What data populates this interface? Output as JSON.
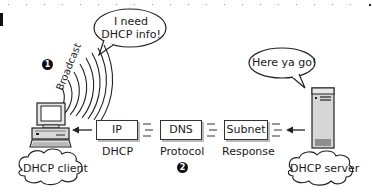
{
  "diagram": {
    "type": "network-flow",
    "client": {
      "label": "DHCP client",
      "speech": "I need\nDHCP info!",
      "speech_line1": "I need",
      "speech_line2": "DHCP info!",
      "signal_label": "Broadcast",
      "step_marker": "1"
    },
    "server": {
      "label": "DHCP server",
      "speech": "Here ya go!"
    },
    "packet_boxes": [
      {
        "text": "IP",
        "caption": "DHCP"
      },
      {
        "text": "DNS",
        "caption": "Protocol"
      },
      {
        "text": "Subnet",
        "caption": "Response"
      }
    ],
    "flow_step_marker": "2",
    "flow_direction": "server-to-client"
  }
}
